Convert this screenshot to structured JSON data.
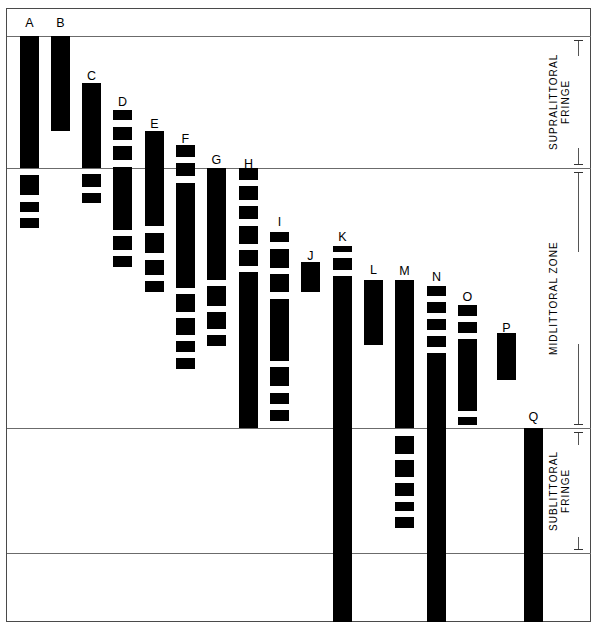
{
  "figure": {
    "background_color": "#ffffff",
    "bar_color": "#000000",
    "frame_color": "#4a4a4a",
    "width": 599,
    "height": 630
  },
  "zones": [
    {
      "id": "supralittoral",
      "label": "SUPRALITTORAL\nFRINGE",
      "top": 36,
      "bottom": 168
    },
    {
      "id": "midlittoral",
      "label": "MIDLITTORAL ZONE",
      "top": 168,
      "bottom": 428
    },
    {
      "id": "sublittoral",
      "label": "SUBLITTORAL\nFRINGE",
      "top": 428,
      "bottom": 553
    }
  ],
  "zone_lines": [
    36,
    168,
    428,
    553
  ],
  "chart_data": {
    "type": "bar",
    "xlabel": "",
    "ylabel": "",
    "orientation": "vertical-range",
    "categories": [
      "A",
      "B",
      "C",
      "D",
      "E",
      "F",
      "G",
      "H",
      "I",
      "J",
      "K",
      "L",
      "M",
      "N",
      "O",
      "P",
      "Q"
    ],
    "zone_boundaries": {
      "supralittoral_top": 36,
      "supralittoral_bottom": 168,
      "midlittoral_bottom": 428,
      "sublittoral_bottom": 553
    },
    "columns": [
      {
        "label": "A",
        "x": 20,
        "width": 19,
        "label_y": 17,
        "segments": [
          [
            36,
            168
          ],
          [
            175,
            195
          ],
          [
            202,
            212
          ],
          [
            218,
            228
          ]
        ]
      },
      {
        "label": "B",
        "x": 51,
        "width": 19,
        "label_y": 17,
        "segments": [
          [
            36,
            131
          ]
        ]
      },
      {
        "label": "C",
        "x": 82,
        "width": 19,
        "label_y": 70,
        "segments": [
          [
            83,
            168
          ],
          [
            174,
            187
          ],
          [
            193,
            203
          ]
        ]
      },
      {
        "label": "D",
        "x": 113,
        "width": 19,
        "label_y": 96,
        "segments": [
          [
            110,
            120
          ],
          [
            127,
            140
          ],
          [
            146,
            160
          ],
          [
            167,
            230
          ],
          [
            236,
            250
          ],
          [
            256,
            267
          ]
        ]
      },
      {
        "label": "E",
        "x": 145,
        "width": 19,
        "label_y": 118,
        "segments": [
          [
            131,
            226
          ],
          [
            233,
            253
          ],
          [
            260,
            275
          ],
          [
            281,
            292
          ]
        ]
      },
      {
        "label": "F",
        "x": 176,
        "width": 19,
        "label_y": 133,
        "segments": [
          [
            145,
            157
          ],
          [
            163,
            176
          ],
          [
            183,
            288
          ],
          [
            294,
            312
          ],
          [
            318,
            335
          ],
          [
            341,
            352
          ],
          [
            358,
            369
          ]
        ]
      },
      {
        "label": "G",
        "x": 207,
        "width": 19,
        "label_y": 154,
        "segments": [
          [
            168,
            280
          ],
          [
            286,
            306
          ],
          [
            312,
            329
          ],
          [
            335,
            346
          ]
        ]
      },
      {
        "label": "H",
        "x": 239,
        "width": 19,
        "label_y": 158,
        "segments": [
          [
            168,
            180
          ],
          [
            186,
            200
          ],
          [
            206,
            219
          ],
          [
            226,
            244
          ],
          [
            250,
            266
          ],
          [
            272,
            428
          ]
        ]
      },
      {
        "label": "I",
        "x": 270,
        "width": 19,
        "label_y": 216,
        "segments": [
          [
            232,
            242
          ],
          [
            249,
            268
          ],
          [
            274,
            292
          ],
          [
            299,
            361
          ],
          [
            367,
            386
          ],
          [
            393,
            404
          ],
          [
            410,
            421
          ]
        ]
      },
      {
        "label": "J",
        "x": 301,
        "width": 19,
        "label_y": 250,
        "segments": [
          [
            262,
            292
          ]
        ]
      },
      {
        "label": "K",
        "x": 333,
        "width": 19,
        "label_y": 231,
        "segments": [
          [
            246,
            252
          ],
          [
            258,
            270
          ],
          [
            276,
            622
          ]
        ]
      },
      {
        "label": "L",
        "x": 364,
        "width": 19,
        "label_y": 264,
        "segments": [
          [
            280,
            345
          ]
        ]
      },
      {
        "label": "M",
        "x": 395,
        "width": 19,
        "label_y": 265,
        "segments": [
          [
            280,
            428
          ],
          [
            436,
            454
          ],
          [
            460,
            477
          ],
          [
            483,
            496
          ],
          [
            502,
            511
          ],
          [
            517,
            528
          ]
        ]
      },
      {
        "label": "N",
        "x": 427,
        "width": 19,
        "label_y": 271,
        "segments": [
          [
            286,
            296
          ],
          [
            302,
            313
          ],
          [
            319,
            330
          ],
          [
            336,
            347
          ],
          [
            353,
            622
          ]
        ]
      },
      {
        "label": "O",
        "x": 458,
        "width": 19,
        "label_y": 291,
        "segments": [
          [
            305,
            316
          ],
          [
            322,
            333
          ],
          [
            339,
            411
          ],
          [
            417,
            425
          ]
        ]
      },
      {
        "label": "P",
        "x": 497,
        "width": 19,
        "label_y": 322,
        "segments": [
          [
            333,
            380
          ]
        ]
      },
      {
        "label": "Q",
        "x": 524,
        "width": 19,
        "label_y": 411,
        "segments": [
          [
            428,
            622
          ]
        ]
      }
    ]
  }
}
